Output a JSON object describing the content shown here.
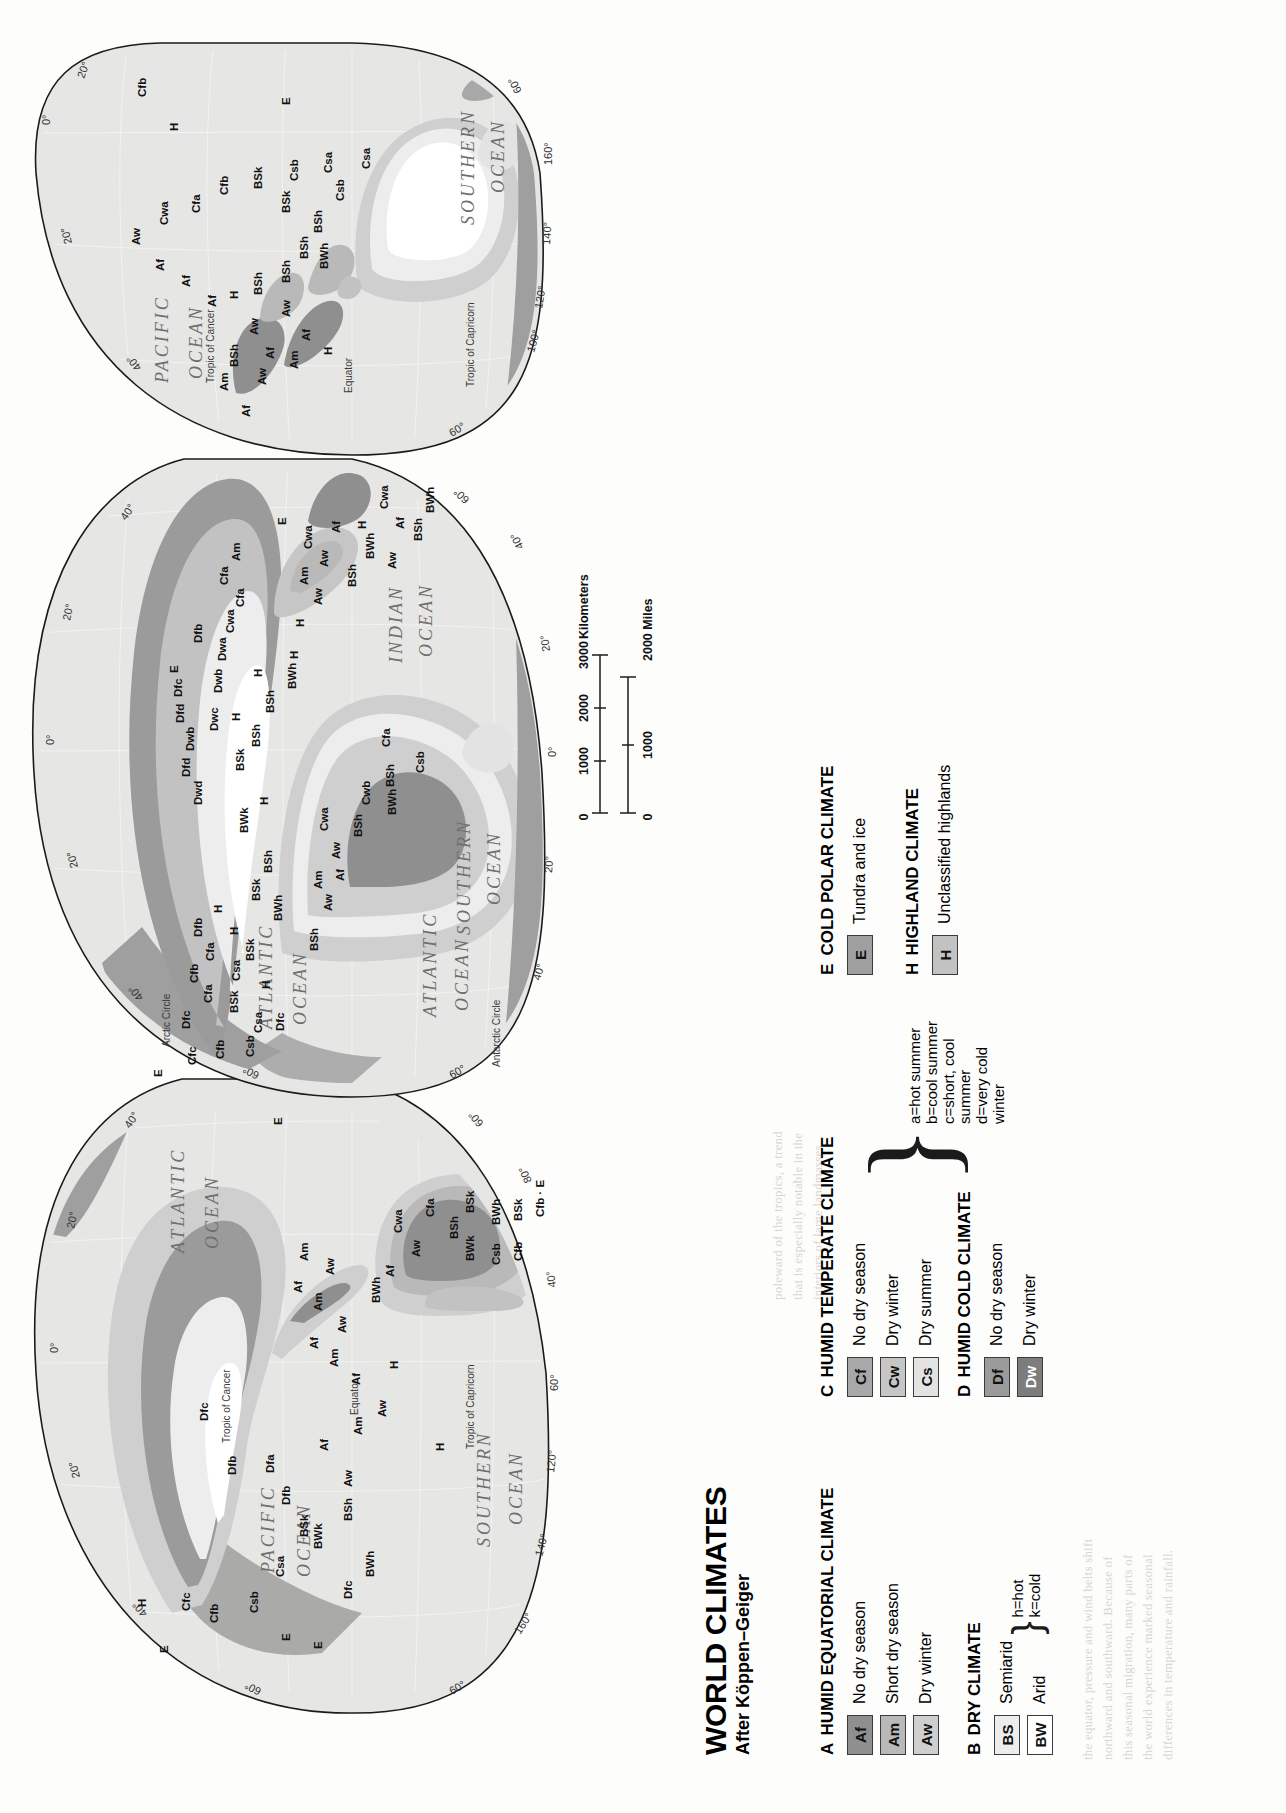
{
  "figure": {
    "title": "WORLD CLIMATES",
    "subtitle": "After Köppen–Geiger"
  },
  "colors": {
    "af": "#8f8f8f",
    "am": "#b9b9b9",
    "aw": "#cfcfcf",
    "bs": "#ededed",
    "bw": "#ffffff",
    "cf": "#a8a8a8",
    "cw": "#c6c6c6",
    "cs": "#e3e3e3",
    "df": "#9b9b9b",
    "dw": "#7d7d7d",
    "e": "#9f9f9f",
    "h": "#c2c2c2",
    "ocean": "#e6e6e4",
    "outline": "#1b1b1b"
  },
  "legend": {
    "groups": [
      {
        "letter": "A",
        "heading": "HUMID EQUATORIAL CLIMATE",
        "items": [
          {
            "code": "Af",
            "label": "No dry season",
            "fill": "#8f8f8f"
          },
          {
            "code": "Am",
            "label": "Short dry season",
            "fill": "#b9b9b9"
          },
          {
            "code": "Aw",
            "label": "Dry winter",
            "fill": "#cfcfcf"
          }
        ]
      },
      {
        "letter": "B",
        "heading": "DRY CLIMATE",
        "items": [
          {
            "code": "BS",
            "label": "Semiarid",
            "fill": "#ededed"
          },
          {
            "code": "BW",
            "label": "Arid",
            "fill": "#ffffff"
          }
        ],
        "modifiers": [
          "h=hot",
          "k=cold"
        ]
      },
      {
        "letter": "C",
        "heading": "HUMID TEMPERATE CLIMATE",
        "items": [
          {
            "code": "Cf",
            "label": "No dry season",
            "fill": "#a8a8a8"
          },
          {
            "code": "Cw",
            "label": "Dry winter",
            "fill": "#c6c6c6"
          },
          {
            "code": "Cs",
            "label": "Dry summer",
            "fill": "#e3e3e3"
          }
        ]
      },
      {
        "letter": "D",
        "heading": "HUMID COLD CLIMATE",
        "items": [
          {
            "code": "Df",
            "label": "No dry season",
            "fill": "#9b9b9b"
          },
          {
            "code": "Dw",
            "label": "Dry winter",
            "fill": "#7d7d7d"
          }
        ],
        "modifiers": [
          "a=hot summer",
          "b=cool summer",
          "c=short, cool summer",
          "d=very cold winter"
        ]
      },
      {
        "letter": "E",
        "heading": "COLD POLAR CLIMATE",
        "items": [
          {
            "code": "E",
            "label": "Tundra and ice",
            "fill": "#9f9f9f"
          }
        ]
      },
      {
        "letter": "H",
        "heading": "HIGHLAND CLIMATE",
        "items": [
          {
            "code": "H",
            "label": "Unclassified highlands",
            "fill": "#c2c2c2"
          }
        ]
      }
    ]
  },
  "scale": {
    "km_ticks": [
      "0",
      "1000",
      "2000",
      "3000"
    ],
    "km_unit": "Kilometers",
    "mi_ticks": [
      "0",
      "1000",
      "2000"
    ],
    "mi_unit": "Miles"
  },
  "map": {
    "ocean_labels": [
      "PACIFIC OCEAN",
      "ATLANTIC OCEAN",
      "ATLANTIC OCEAN",
      "ATLANTIC OCEAN",
      "INDIAN OCEAN",
      "PACIFIC OCEAN",
      "SOUTHERN OCEAN",
      "SOUTHERN OCEAN"
    ],
    "reference_lines": [
      "Equator",
      "Tropic of Cancer",
      "Tropic of Capricorn",
      "Arctic Circle",
      "Antarctic Circle"
    ],
    "graticule_labels": [
      "0°",
      "20°",
      "40°",
      "60°",
      "80°",
      "100°",
      "120°",
      "140°",
      "160°"
    ],
    "codes": [
      "Af",
      "Am",
      "Aw",
      "BSh",
      "BSk",
      "BWh",
      "BWk",
      "Cfa",
      "Cfb",
      "Cfc",
      "Csa",
      "Csb",
      "Cwa",
      "Cwb",
      "Dfa",
      "Dfb",
      "Dfc",
      "Dfd",
      "Dwb",
      "Dwc",
      "Dwd",
      "E",
      "H"
    ]
  }
}
